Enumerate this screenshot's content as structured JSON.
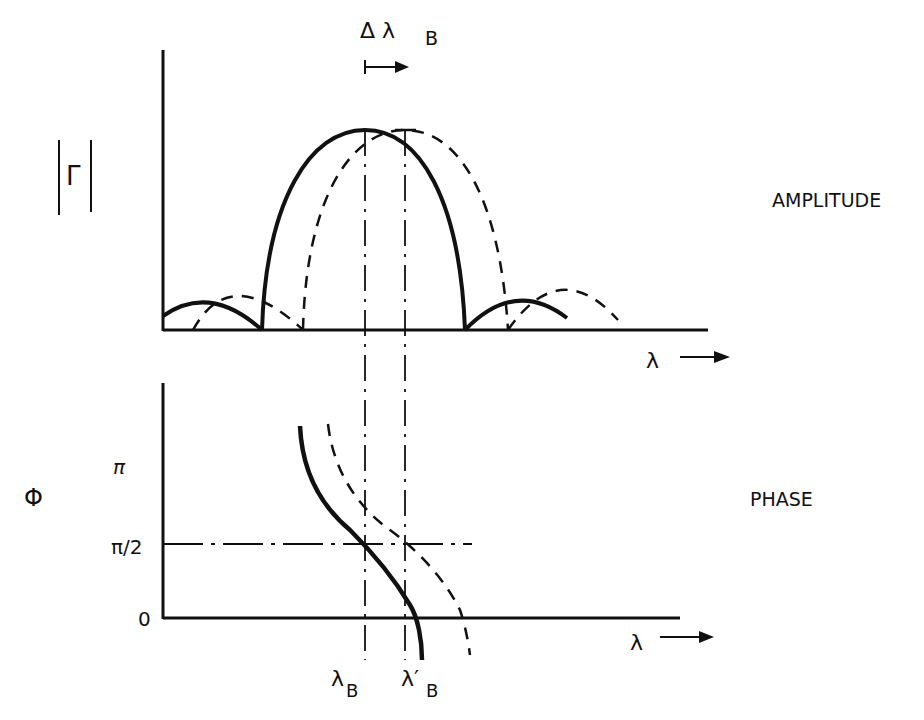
{
  "figure": {
    "top_panel": {
      "y_label": "|Γ|",
      "y_label_glyph": "Γ",
      "x_label": "λ",
      "side_label": "AMPLITUDE",
      "shift_label": "Δ λ",
      "shift_label_sub": "B"
    },
    "bottom_panel": {
      "y_label": "Φ",
      "x_label": "λ",
      "side_label": "PHASE",
      "y_ticks": [
        "π",
        "π/2",
        "0"
      ]
    },
    "markers": {
      "lambda_b": "λ",
      "lambda_b_sub": "B",
      "lambda_b_prime": "λ′",
      "lambda_b_prime_sub": "B"
    },
    "legend": {
      "solid": "original Bragg response",
      "dashed": "shifted response (Δλ_B)"
    },
    "colors": {
      "ink": "#111111",
      "background": "#ffffff"
    }
  }
}
